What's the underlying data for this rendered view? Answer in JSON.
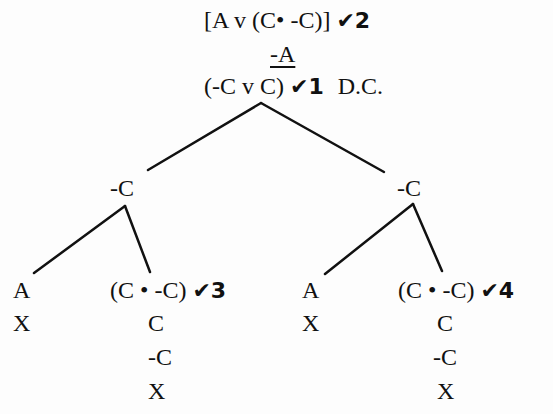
{
  "tree": {
    "premise": {
      "formula": "[A v (C• -C)]",
      "check": "✔2"
    },
    "conclusion_negated": {
      "formula": "-A"
    },
    "derived": {
      "formula": "(-C v C)",
      "check": "✔1",
      "justification": "D.C."
    },
    "branches": [
      {
        "node": "-C",
        "children": [
          {
            "formula": "A",
            "below": [
              "X"
            ]
          },
          {
            "formula": "(C • -C)",
            "check": "✔3",
            "below": [
              "C",
              "-C",
              "X"
            ]
          }
        ]
      },
      {
        "node": "-C",
        "children": [
          {
            "formula": "A",
            "below": [
              "X"
            ]
          },
          {
            "formula": "(C • -C)",
            "check": "✔4",
            "below": [
              "C",
              "-C",
              "X"
            ]
          }
        ]
      }
    ]
  },
  "colors": {
    "ink": "#111111",
    "background": "#fdfdfd"
  }
}
